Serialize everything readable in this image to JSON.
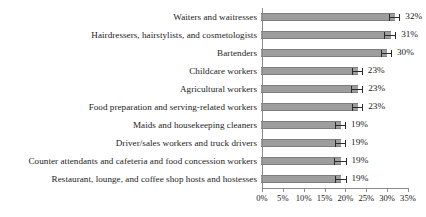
{
  "chart_data": {
    "type": "bar",
    "orientation": "horizontal",
    "title": "",
    "subtitle": "",
    "xlabel": "",
    "ylabel": "",
    "xlim": [
      0,
      35
    ],
    "xtick_values": [
      0,
      5,
      10,
      15,
      20,
      25,
      30,
      35
    ],
    "xtick_labels": [
      "0%",
      "5%",
      "10%",
      "15%",
      "20%",
      "25%",
      "30%",
      "35%"
    ],
    "grid": false,
    "legend": null,
    "value_suffix": "%",
    "bar_color": "#9d9d9d",
    "bar_edge_color": "#7e7e7e",
    "error_bar_color": "#2b2b2b",
    "axis_color": "#8b8b8b",
    "categories": [
      "Waiters and waitresses",
      "Hairdressers, hairstylists, and cosmetologists",
      "Bartenders",
      "Childcare workers",
      "Agricultural workers",
      "Food preparation and serving-related workers",
      "Maids and housekeeping cleaners",
      "Driver/sales workers and truck drivers",
      "Counter attendants and cafeteria and food concession workers",
      "Restaurant, lounge, and coffee shop hosts and hostesses"
    ],
    "values": [
      32,
      31,
      30,
      23,
      23,
      23,
      19,
      19,
      19,
      19
    ],
    "value_labels": [
      "32%",
      "31%",
      "30%",
      "23%",
      "23%",
      "23%",
      "19%",
      "19%",
      "19%",
      "19%"
    ],
    "error_low": [
      30.6,
      29.6,
      28.8,
      21.7,
      21.6,
      21.7,
      17.8,
      17.7,
      17.6,
      17.7
    ],
    "error_high": [
      33.4,
      32.4,
      31.4,
      24.4,
      24.5,
      24.5,
      20.4,
      20.4,
      20.5,
      20.5
    ]
  }
}
